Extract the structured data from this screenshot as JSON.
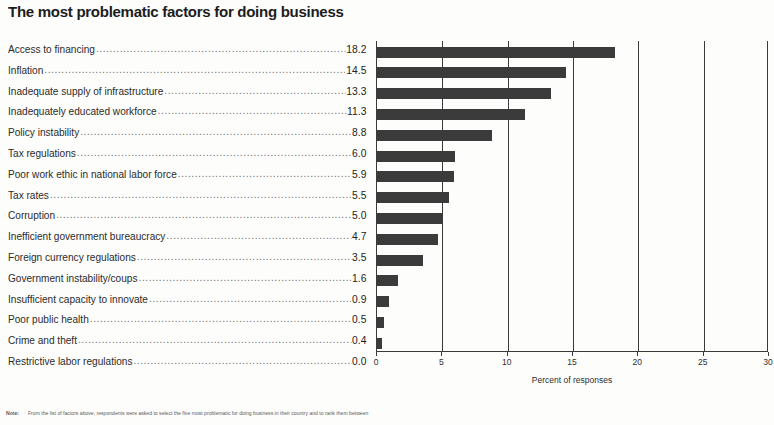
{
  "chart_data": {
    "type": "bar",
    "orientation": "horizontal",
    "title": "The most problematic factors for doing business",
    "xlabel": "Percent of responses",
    "ylabel": "",
    "xlim": [
      0,
      30
    ],
    "xticks": [
      0,
      5,
      10,
      15,
      20,
      25,
      30
    ],
    "grid": true,
    "legend": null,
    "bar_color": "#3b3b3b",
    "categories": [
      "Access to financing",
      "Inflation",
      "Inadequate supply of infrastructure",
      "Inadequately educated workforce",
      "Policy instability",
      "Tax regulations",
      "Poor work ethic in national labor force",
      "Tax rates",
      "Corruption",
      "Inefficient government bureaucracy",
      "Foreign currency regulations",
      "Government instability/coups",
      "Insufficient capacity to innovate",
      "Poor public health",
      "Crime and theft",
      "Restrictive labor regulations"
    ],
    "values": [
      18.2,
      14.5,
      13.3,
      11.3,
      8.8,
      6.0,
      5.9,
      5.5,
      5.0,
      4.7,
      3.5,
      1.6,
      0.9,
      0.5,
      0.4,
      0.0
    ],
    "value_labels": [
      "18.2",
      "14.5",
      "13.3",
      "11.3",
      "8.8",
      "6.0",
      "5.9",
      "5.5",
      "5.0",
      "4.7",
      "3.5",
      "1.6",
      "0.9",
      "0.5",
      "0.4",
      "0.0"
    ]
  },
  "note": {
    "label": "Note:",
    "text": "From the list of factors above, respondents were asked to select the five most problematic for doing business in their country and to rank them between"
  }
}
